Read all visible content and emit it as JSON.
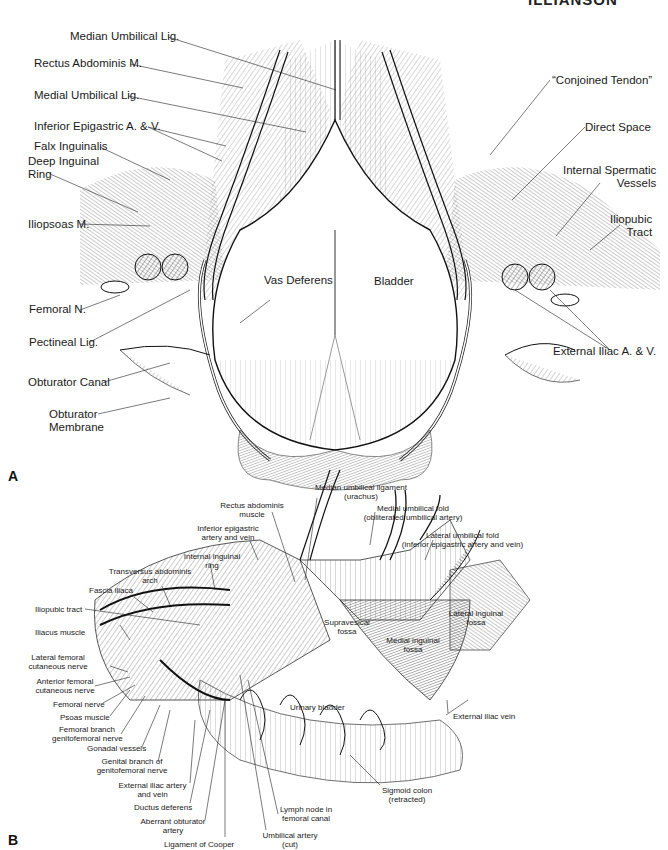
{
  "running_header": "ILLIANSON",
  "panel_a": {
    "letter": "A",
    "labels": {
      "median_umbilical_lig": "Median Umbilical Lig.",
      "rectus_abdominis": "Rectus Abdominis M.",
      "medial_umbilical_lig": "Medial Umbilical Lig.",
      "inferior_epigastric": "Inferior Epigastric A. & V.",
      "falx_inguinalis": "Falx Inguinalis",
      "deep_inguinal_ring_1": "Deep Inguinal",
      "deep_inguinal_ring_2": "Ring",
      "iliopsoas": "Iliopsoas M.",
      "femoral_n": "Femoral N.",
      "pectineal_lig": "Pectineal Lig.",
      "obturator_canal": "Obturator Canal",
      "obturator_membrane_1": "Obturator",
      "obturator_membrane_2": "Membrane",
      "vas_deferens": "Vas Deferens",
      "bladder": "Bladder",
      "conjoined_tendon": "“Conjoined Tendon”",
      "direct_space": "Direct Space",
      "internal_spermatic_1": "Internal Spermatic",
      "internal_spermatic_2": "Vessels",
      "iliopubic_tract_1": "Iliopubic",
      "iliopubic_tract_2": "Tract",
      "external_iliac": "External Iliac A. & V."
    }
  },
  "panel_b": {
    "letter": "B",
    "labels": {
      "median_umbilical_ligament_1": "Median umbilical ligament",
      "median_umbilical_ligament_2": "(urachus)",
      "rectus_abdominis_1": "Rectus abdominis",
      "rectus_abdominis_2": "muscle",
      "medial_umbilical_fold_1": "Medial umbilical fold",
      "medial_umbilical_fold_2": "(obliterated umbilical artery)",
      "inferior_epigastric_1": "Inferior epigastric",
      "inferior_epigastric_2": "artery and vein",
      "lateral_umbilical_fold_1": "Lateral umbilical fold",
      "lateral_umbilical_fold_2": "(inferior epigastric artery and vein)",
      "internal_inguinal_ring_1": "Internal inguinal",
      "internal_inguinal_ring_2": "ring",
      "transversus_arch_1": "Transversus abdominis",
      "transversus_arch_2": "arch",
      "fascia_iliaca": "Fascia iliaca",
      "iliopubic_tract": "Iliopubic tract",
      "iliacus_muscle": "Iliacus muscle",
      "supravesical_fossa_1": "Supravesical",
      "supravesical_fossa_2": "fossa",
      "lateral_inguinal_fossa_1": "Lateral inguinal",
      "lateral_inguinal_fossa_2": "fossa",
      "medial_inguinal_fossa_1": "Medial inguinal",
      "medial_inguinal_fossa_2": "fossa",
      "lateral_femoral_cutaneous_1": "Lateral femoral",
      "lateral_femoral_cutaneous_2": "cutaneous nerve",
      "anterior_femoral_cutaneous_1": "Anterior femoral",
      "anterior_femoral_cutaneous_2": "cutaneous nerve",
      "femoral_nerve": "Femoral nerve",
      "psoas_muscle": "Psoas muscle",
      "femoral_branch_1": "Femoral branch",
      "femoral_branch_2": "genitofemoral nerve",
      "gonadal_vessels": "Gonadal vessels",
      "genital_branch_1": "Genital branch of",
      "genital_branch_2": "genitofemoral nerve",
      "external_iliac_artery_1": "External iliac artery",
      "external_iliac_artery_2": "and vein",
      "ductus_deferens": "Ductus deferens",
      "aberrant_obturator_1": "Aberrant obturator",
      "aberrant_obturator_2": "artery",
      "ligament_of_cooper": "Ligament of Cooper",
      "urinary_bladder": "Urinary bladder",
      "external_iliac_vein": "External iliac vein",
      "sigmoid_colon_1": "Sigmoid colon",
      "sigmoid_colon_2": "(retracted)",
      "lymph_node_1": "Lymph node in",
      "lymph_node_2": "femoral canal",
      "umbilical_artery_1": "Umbilical artery",
      "umbilical_artery_2": "(cut)"
    }
  }
}
